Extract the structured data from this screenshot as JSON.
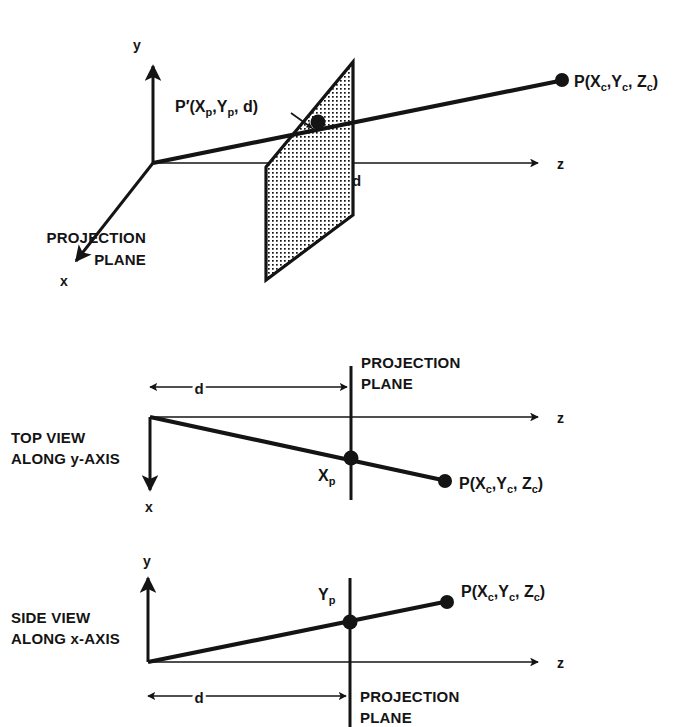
{
  "figure": {
    "color_ink": "#141414",
    "color_background": "#ffffff"
  },
  "panels": {
    "perspective": {
      "axis_x_label": "x",
      "axis_y_label": "y",
      "axis_z_label": "z",
      "point_label": "P(X",
      "point_label_sub1": "c",
      "point_label_mid": ",Y",
      "point_label_sub2": "c",
      "point_label_end": ", Z",
      "point_label_sub3": "c",
      "point_label_close": ")",
      "projected_label_prefix": "P′(X",
      "projected_label_sub1": "p",
      "projected_label_mid": ",Y",
      "projected_label_sub2": "p",
      "projected_label_end": ", d)",
      "distance_label": "d",
      "plane_label_line1": "PROJECTION",
      "plane_label_line2": "PLANE"
    },
    "top_view": {
      "caption_line1": "TOP VIEW",
      "caption_line2": "ALONG y-AXIS",
      "axis_x_label": "x",
      "axis_z_label": "z",
      "distance_label": "d",
      "projected_label": "X",
      "projected_label_sub": "p",
      "point_label": "P(X",
      "point_label_sub1": "c",
      "point_label_mid": ",Y",
      "point_label_sub2": "c",
      "point_label_end": ", Z",
      "point_label_sub3": "c",
      "point_label_close": ")",
      "plane_label_line1": "PROJECTION",
      "plane_label_line2": "PLANE"
    },
    "side_view": {
      "caption_line1": "SIDE VIEW",
      "caption_line2": "ALONG x-AXIS",
      "axis_y_label": "y",
      "axis_z_label": "z",
      "distance_label": "d",
      "projected_label": "Y",
      "projected_label_sub": "p",
      "point_label": "P(X",
      "point_label_sub1": "c",
      "point_label_mid": ",Y",
      "point_label_sub2": "c",
      "point_label_end": ", Z",
      "point_label_sub3": "c",
      "point_label_close": ")",
      "plane_label_line1": "PROJECTION",
      "plane_label_line2": "PLANE"
    }
  }
}
